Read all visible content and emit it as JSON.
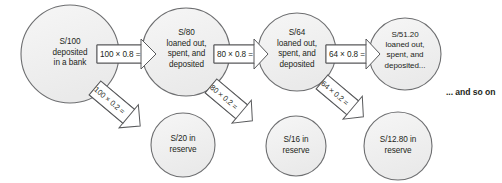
{
  "diagram": {
    "tail_note": "... and so on",
    "colors": {
      "circle_fill": "#f1f1f1",
      "circle_stroke": "#6d6e70",
      "arrow_fill": "#ffffff",
      "arrow_stroke": "#58595b",
      "text": "#231f20",
      "background": "#ffffff"
    },
    "deposit_nodes": [
      {
        "id": "deposit-1",
        "lines": [
          "S/100",
          "deposited",
          "in a bank"
        ],
        "cx": 70,
        "cy": 54,
        "r": 49
      },
      {
        "id": "deposit-2",
        "lines": [
          "S/80",
          "loaned out,",
          "spent, and",
          "deposited"
        ],
        "cx": 186,
        "cy": 52,
        "r": 44
      },
      {
        "id": "deposit-3",
        "lines": [
          "S/64",
          "loaned out,",
          "spent, and",
          "deposited"
        ],
        "cx": 297,
        "cy": 52,
        "r": 39
      },
      {
        "id": "deposit-4",
        "lines": [
          "S/51.20",
          "loaned out,",
          "spent, and",
          "deposited..."
        ],
        "cx": 405,
        "cy": 54,
        "r": 36
      }
    ],
    "reserve_nodes": [
      {
        "id": "reserve-1",
        "lines": [
          "S/20 in",
          "reserve"
        ],
        "cx": 183,
        "cy": 145,
        "r": 32
      },
      {
        "id": "reserve-2",
        "lines": [
          "S/16 in",
          "reserve"
        ],
        "cx": 296,
        "cy": 146,
        "r": 30
      },
      {
        "id": "reserve-3",
        "lines": [
          "S/12.80 in",
          "reserve"
        ],
        "cx": 398,
        "cy": 146,
        "r": 34
      }
    ],
    "loan_arrows": [
      {
        "id": "loan-arrow-1",
        "label": "100 × 0.8 =",
        "x": 98,
        "y": 45,
        "w": 47,
        "h": 18
      },
      {
        "id": "loan-arrow-2",
        "label": "80 × 0.8 =",
        "x": 215,
        "y": 45,
        "w": 43,
        "h": 18
      },
      {
        "id": "loan-arrow-3",
        "label": "64 × 0.8 =",
        "x": 327,
        "y": 45,
        "w": 43,
        "h": 18
      }
    ],
    "reserve_arrows": [
      {
        "id": "reserve-arrow-1",
        "label": "100 × 0.2 =",
        "x1": 98,
        "y1": 92,
        "x2": 156,
        "y2": 132
      },
      {
        "id": "reserve-arrow-2",
        "label": "80 × 0.2 =",
        "x1": 214,
        "y1": 90,
        "x2": 266,
        "y2": 130
      },
      {
        "id": "reserve-arrow-3",
        "label": "64 × 0.2 =",
        "x1": 325,
        "y1": 86,
        "x2": 372,
        "y2": 126
      }
    ]
  }
}
